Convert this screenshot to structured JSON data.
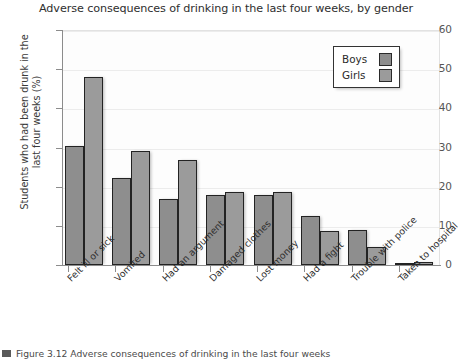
{
  "chart_data": {
    "type": "bar",
    "title": "Adverse consequences of drinking in the last four weeks, by gender",
    "xlabel": "",
    "ylabel": "Students who had been drunk in the last four weeks (%)",
    "ylim": [
      0,
      60
    ],
    "yticks": [
      0,
      10,
      20,
      30,
      40,
      50,
      60
    ],
    "ytick_labels": [
      "0",
      "10",
      "20",
      "30",
      "40",
      "50",
      "60"
    ],
    "grid": true,
    "legend_position": "top-right",
    "categories": [
      "Felt ill or sick",
      "Vomited",
      "Had an argument",
      "Damaged clothes",
      "Lost money",
      "Had a fight",
      "Trouble with police",
      "Taken to hospital"
    ],
    "series": [
      {
        "name": "Boys",
        "color": "#8e8e8e",
        "values": [
          30.5,
          22.3,
          16.8,
          17.8,
          17.8,
          12.6,
          9.0,
          0.4
        ]
      },
      {
        "name": "Girls",
        "color": "#9b9b9b",
        "values": [
          48.0,
          29.0,
          26.8,
          18.6,
          18.7,
          8.6,
          4.7,
          0.8
        ]
      }
    ]
  },
  "legend": {
    "entries": [
      {
        "label": "Boys",
        "color": "#8e8e8e"
      },
      {
        "label": "Girls",
        "color": "#9b9b9b"
      }
    ]
  },
  "caption": {
    "marker": "figure-marker",
    "text": "Figure 3.12  Adverse consequences of drinking in the last four weeks"
  }
}
